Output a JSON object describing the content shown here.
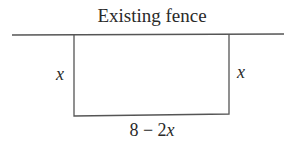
{
  "diagram": {
    "title": "Existing fence",
    "left_side_label": "x",
    "right_side_label": "x",
    "bottom_label_prefix": "8 − 2",
    "bottom_label_var": "x",
    "colors": {
      "line": "#555555",
      "text": "#2a2a2a",
      "background": "#ffffff"
    }
  }
}
